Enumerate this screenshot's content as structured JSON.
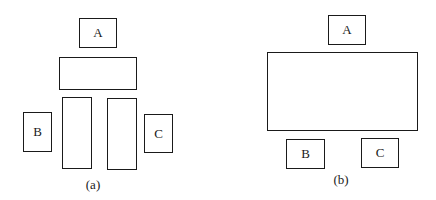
{
  "figure_a": {
    "caption": "(a)",
    "labels": {
      "a": "A",
      "b": "B",
      "c": "C"
    }
  },
  "figure_b": {
    "caption": "(b)",
    "labels": {
      "a": "A",
      "b": "B",
      "c": "C"
    }
  }
}
